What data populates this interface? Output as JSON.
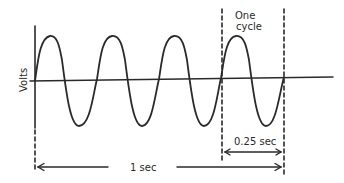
{
  "diagram": {
    "type": "ac-sine-wave",
    "y_axis_label": "Volts",
    "cycle_label_line1": "One",
    "cycle_label_line2": "cycle",
    "period_label": "0.25 sec",
    "total_time_label": "1 sec",
    "cycles_shown": 4,
    "frequency_hz": 4,
    "line_color": "#2a2a2a"
  }
}
